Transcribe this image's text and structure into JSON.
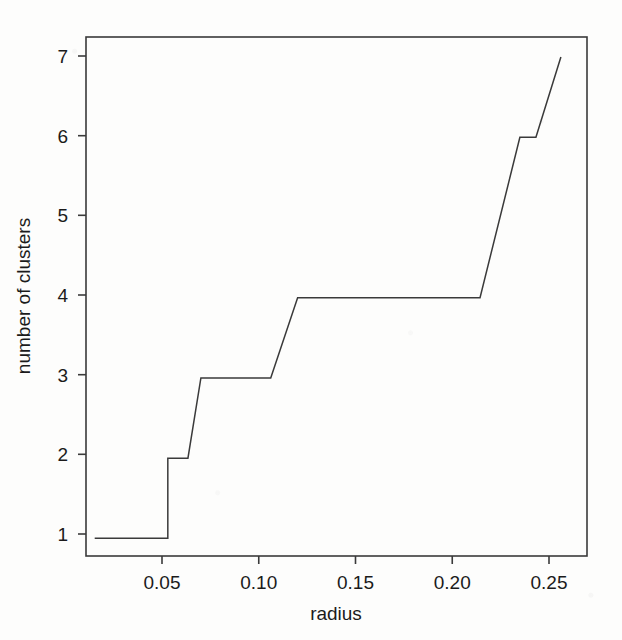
{
  "figure": {
    "background_color": "#fdfdfc",
    "ink_color": "#3a3a3a",
    "text_color": "#1b1b1b"
  },
  "chart_data": {
    "type": "line",
    "subtype": "step",
    "title": "",
    "xlabel": "radius",
    "ylabel": "number of clusters",
    "xlim": [
      0.0155,
      0.2745
    ],
    "ylim": [
      0.78,
      7.25
    ],
    "grid": false,
    "legend": null,
    "x_ticks": [
      0.05,
      0.1,
      0.15,
      0.2,
      0.25
    ],
    "x_tick_labels": [
      "0.05",
      "0.10",
      "0.15",
      "0.20",
      "0.25"
    ],
    "y_ticks": [
      1,
      2,
      3,
      4,
      5,
      6,
      7
    ],
    "y_tick_labels": [
      "1",
      "2",
      "3",
      "4",
      "5",
      "6",
      "7"
    ],
    "series": [
      {
        "name": "clusters",
        "x": [
          0.02,
          0.0578,
          0.0578,
          0.0682,
          0.0749,
          0.111,
          0.1249,
          0.2192,
          0.2398,
          0.2481,
          0.261
        ],
        "y": [
          1,
          1,
          2,
          2,
          3,
          3,
          4,
          4,
          6,
          6,
          7
        ]
      }
    ],
    "steps": [
      {
        "radius_start": 0.02,
        "radius_end": 0.058,
        "clusters": 1
      },
      {
        "radius_start": 0.058,
        "radius_end": 0.068,
        "clusters": 2
      },
      {
        "radius_start": 0.075,
        "radius_end": 0.111,
        "clusters": 3
      },
      {
        "radius_start": 0.125,
        "radius_end": 0.219,
        "clusters": 4
      },
      {
        "radius_start": 0.24,
        "radius_end": 0.248,
        "clusters": 6
      },
      {
        "radius_start": 0.261,
        "radius_end": 0.261,
        "clusters": 7
      }
    ]
  },
  "axes": {
    "x_axis_label": "radius",
    "y_axis_label": "number of clusters"
  }
}
